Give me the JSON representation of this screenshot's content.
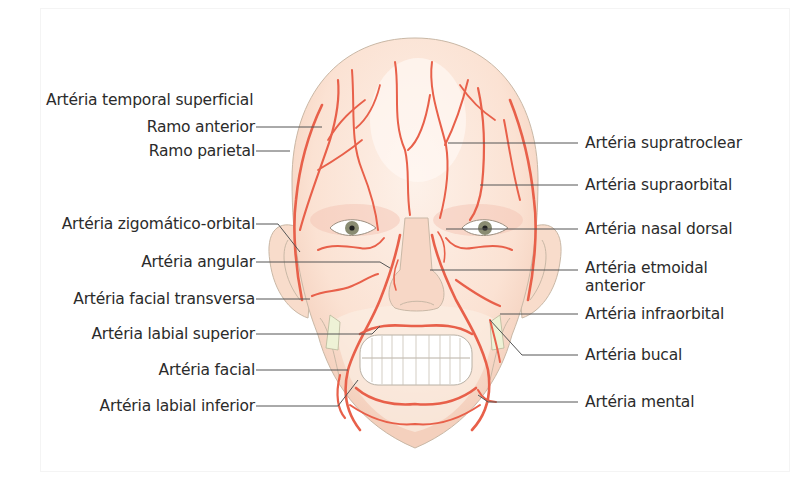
{
  "figure": {
    "colors": {
      "artery": "#e8604a",
      "skin": "#fbe3d4",
      "skin_shadow": "#f3cbb6",
      "teeth": "#ffffff",
      "iris": "#8a8c72",
      "leader_line": "#555555",
      "text": "#2b2b2b"
    }
  },
  "labels": {
    "left": [
      {
        "id": "temporal_sup",
        "text": "Artéria temporal superficial"
      },
      {
        "id": "ramo_anterior",
        "text": "Ramo anterior"
      },
      {
        "id": "ramo_parietal",
        "text": "Ramo parietal"
      },
      {
        "id": "zigomatico_orbital",
        "text": "Artéria zigomático-orbital"
      },
      {
        "id": "angular",
        "text": "Artéria angular"
      },
      {
        "id": "facial_transversa",
        "text": "Artéria facial transversa"
      },
      {
        "id": "labial_superior",
        "text": "Artéria labial superior"
      },
      {
        "id": "facial",
        "text": "Artéria facial"
      },
      {
        "id": "labial_inferior",
        "text": "Artéria labial inferior"
      }
    ],
    "right": [
      {
        "id": "supratroclear",
        "text": "Artéria supratroclear"
      },
      {
        "id": "supraorbital",
        "text": "Artéria supraorbital"
      },
      {
        "id": "nasal_dorsal",
        "text": "Artéria nasal dorsal"
      },
      {
        "id": "etmoidal_anterior",
        "text": "Artéria etmoidal",
        "text_line2": "anterior"
      },
      {
        "id": "infraorbital",
        "text": "Artéria infraorbital"
      },
      {
        "id": "bucal",
        "text": "Artéria bucal"
      },
      {
        "id": "mental",
        "text": "Artéria mental"
      }
    ]
  }
}
